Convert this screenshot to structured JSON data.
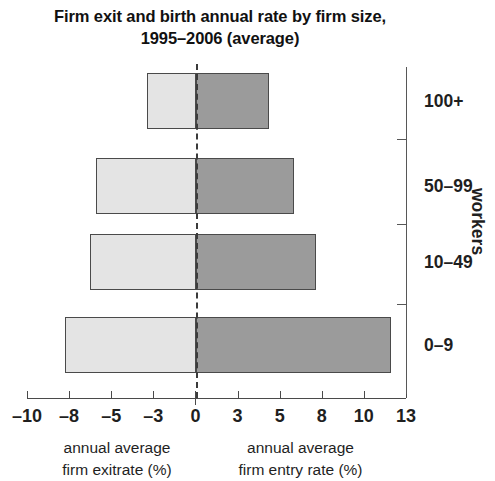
{
  "chart_data": {
    "type": "bar",
    "orientation": "horizontal",
    "subtype": "diverging-paired",
    "title": "Firm exit and birth annual rate by firm size, 1995–2006 (average)",
    "title_lines": [
      "Firm exit and birth annual rate by firm size,",
      "1995–2006 (average)"
    ],
    "categories": [
      "100+",
      "50–99",
      "10–49",
      "0–9"
    ],
    "ylabel": "workers",
    "xlabel": "",
    "series": [
      {
        "name": "annual average firm exit rate (%)",
        "key": "exit",
        "color": "#e4e4e4",
        "values": [
          -3.3,
          -6.1,
          -6.5,
          -8.2
        ]
      },
      {
        "name": "annual average firm entry rate (%)",
        "key": "entry",
        "color": "#9b9b9b",
        "values": [
          4.5,
          6.0,
          7.6,
          11.9
        ]
      }
    ],
    "xticks": [
      -10,
      -8,
      -5,
      -3,
      0,
      3,
      5,
      8,
      10,
      13
    ],
    "xtick_labels": [
      "–10",
      "–8",
      "–5",
      "–3",
      "0",
      "3",
      "5",
      "8",
      "10",
      "13"
    ],
    "xlim": [
      -10,
      13
    ],
    "x_scale_note": "tick labels are evenly spaced although values are unevenly spaced",
    "grid": false,
    "legend": "none",
    "zero_line": {
      "value": 0,
      "style": "dashed",
      "color": "#3b3b3b"
    }
  },
  "captions": {
    "left": {
      "line1": "annual average",
      "line2": "firm exitrate (%)"
    },
    "right": {
      "line1": "annual average",
      "line2": "firm entry rate (%)"
    }
  },
  "colors": {
    "exit_fill": "#e4e4e4",
    "entry_fill": "#9b9b9b",
    "bar_outline": "#4a4a4a",
    "axis": "#575757",
    "text": "#1f1f1f"
  }
}
